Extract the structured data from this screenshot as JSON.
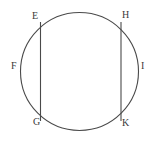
{
  "figure": {
    "name": "circle-with-two-vertical-chords",
    "background_color": "#ffffff",
    "stroke_color": "#4a4a4a",
    "label_color": "#3a3a3a",
    "circle": {
      "cx": 79.5,
      "cy": 71.5,
      "r": 59
    },
    "chords": [
      {
        "name": "chord-EG",
        "x": 40.5,
        "y1": 22.0,
        "y2": 121.0
      },
      {
        "name": "chord-HK",
        "x": 121.0,
        "y1": 22.0,
        "y2": 121.0
      }
    ],
    "labels": [
      {
        "key": "E",
        "text": "E",
        "x": 32,
        "y": 11
      },
      {
        "key": "H",
        "text": "H",
        "x": 122,
        "y": 10
      },
      {
        "key": "F",
        "text": "F",
        "x": 11,
        "y": 61
      },
      {
        "key": "I",
        "text": "I",
        "x": 141,
        "y": 61
      },
      {
        "key": "G",
        "text": "G",
        "x": 33,
        "y": 117
      },
      {
        "key": "K",
        "text": "K",
        "x": 122,
        "y": 118
      }
    ],
    "label_text": {
      "E": "E",
      "F": "F",
      "G": "G",
      "H": "H",
      "I": "I",
      "K": "K"
    }
  }
}
